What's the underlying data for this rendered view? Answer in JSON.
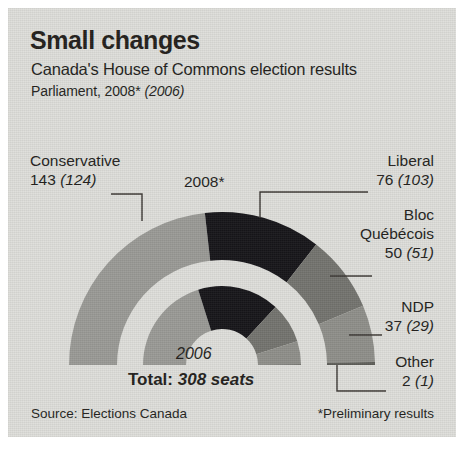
{
  "header": {
    "title": "Small changes",
    "subtitle": "Canada's House of Commons election results",
    "parliament_prefix": "Parliament, 2008* ",
    "parliament_prev": "(2006)"
  },
  "chart_labels": {
    "outer_ring": "2008*",
    "inner_ring": "2006",
    "total_prefix": "Total: ",
    "total_value": "308 seats"
  },
  "footer": {
    "source": "Source: Elections Canada",
    "footnote": "*Preliminary results"
  },
  "callouts": {
    "conservative": {
      "name": "Conservative",
      "current": "143",
      "previous": "(124)"
    },
    "liberal": {
      "name": "Liberal",
      "current": "76",
      "previous": "(103)"
    },
    "bloc": {
      "name": "Bloc\nQuébécois",
      "current": "50",
      "previous": "(51)"
    },
    "ndp": {
      "name": "NDP",
      "current": "37",
      "previous": "(29)"
    },
    "other": {
      "name": "Other",
      "current": "2",
      "previous": "(1)"
    }
  },
  "colors": {
    "background": "#dededa",
    "text": "#231f1c",
    "conservative": "#9a9a96",
    "liberal": "#17161a",
    "bloc": "#74746f",
    "ndp": "#8f8f8a",
    "other": "#5e5e59",
    "gap": "#dededa"
  },
  "chart_data": {
    "type": "pie",
    "title": "Canada's House of Commons election results",
    "subtitle": "Parliament, 2008* (2006)",
    "shape": "semicircle-donut",
    "total_seats": 308,
    "legend_position": "callouts",
    "rings": [
      {
        "name": "2008*",
        "ring": "outer",
        "total": 308,
        "categories": [
          "Conservative",
          "Liberal",
          "Bloc Québécois",
          "NDP",
          "Other"
        ],
        "values": [
          143,
          76,
          50,
          37,
          2
        ],
        "colors": [
          "#9a9a96",
          "#17161a",
          "#74746f",
          "#8f8f8a",
          "#5e5e59"
        ]
      },
      {
        "name": "2006",
        "ring": "inner",
        "total": 308,
        "categories": [
          "Conservative",
          "Liberal",
          "Bloc Québécois",
          "NDP",
          "Other"
        ],
        "values": [
          124,
          103,
          51,
          29,
          1
        ],
        "colors": [
          "#9a9a96",
          "#17161a",
          "#74746f",
          "#8f8f8a",
          "#5e5e59"
        ]
      }
    ],
    "annotations": [
      "Total: 308 seats",
      "Source: Elections Canada",
      "*Preliminary results"
    ]
  }
}
